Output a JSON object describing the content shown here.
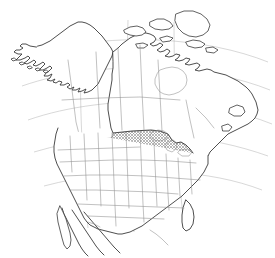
{
  "figure": {
    "type": "distribution-range-map",
    "projection": "conic",
    "background_color": "#ffffff",
    "width": 275,
    "height": 258
  },
  "style": {
    "coastline_color": "#3a3a3a",
    "internal_border_color": "#8e8e8e",
    "graticule_color": "#a8a8a8",
    "range_fill_color": "#b4b4b4",
    "range_pattern": "diagonal-crosshatch"
  },
  "legend": {
    "range_label": "Shaded area indicates species distribution range",
    "unshaded_label": "Unshaded area indicates species absent"
  },
  "regions": [
    {
      "name": "Alaska",
      "shaded": false
    },
    {
      "name": "Canada",
      "shaded": false
    },
    {
      "name": "Greenland",
      "shaded": false
    },
    {
      "name": "Mexico",
      "shaded": false
    },
    {
      "name": "Western United States",
      "shaded": false
    },
    {
      "name": "New England",
      "shaded": false
    },
    {
      "name": "Florida peninsula",
      "shaded": false
    },
    {
      "name": "Great Plains",
      "shaded": true
    },
    {
      "name": "Midwest",
      "shaded": true
    },
    {
      "name": "Texas",
      "shaded": true
    },
    {
      "name": "Southeastern United States",
      "shaded": true
    },
    {
      "name": "Mid-Atlantic",
      "shaded": true
    }
  ],
  "map_features": {
    "water_bodies": [
      "Hudson Bay",
      "Great Lakes",
      "Gulf of Mexico",
      "Atlantic Ocean",
      "Pacific Ocean"
    ],
    "shows_state_boundaries": true,
    "shows_province_boundaries": true,
    "shows_graticule": true
  }
}
